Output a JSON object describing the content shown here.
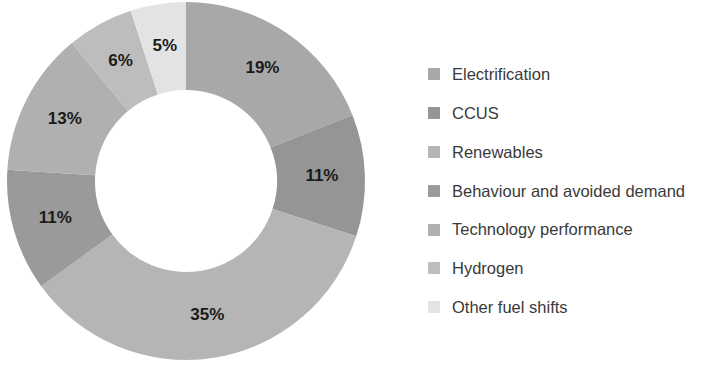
{
  "chart_data": {
    "type": "pie",
    "variant": "donut",
    "title": "",
    "subtitle": "",
    "xlabel": "",
    "ylabel": "",
    "units": "percent",
    "total": 100,
    "grid": false,
    "legend_position": "right",
    "start_angle_deg": 0,
    "direction": "clockwise",
    "inner_radius_ratio": 0.51,
    "categories": [
      "Electrification",
      "CCUS",
      "Renewables",
      "Behaviour and avoided demand",
      "Technology performance",
      "Hydrogen",
      "Other fuel shifts"
    ],
    "values": [
      19,
      11,
      35,
      11,
      13,
      6,
      5
    ],
    "value_labels": [
      "19%",
      "11%",
      "35%",
      "11%",
      "13%",
      "6%",
      "5%"
    ],
    "colors": [
      "#a8a8a8",
      "#959595",
      "#b5b5b5",
      "#9a9a9a",
      "#b0b0b0",
      "#bdbdbd",
      "#e3e3e3"
    ],
    "slices": [
      {
        "label": "Electrification",
        "value": 19,
        "value_label": "19%",
        "color": "#a8a8a8"
      },
      {
        "label": "CCUS",
        "value": 11,
        "value_label": "11%",
        "color": "#959595"
      },
      {
        "label": "Renewables",
        "value": 35,
        "value_label": "35%",
        "color": "#b5b5b5"
      },
      {
        "label": "Behaviour and avoided demand",
        "value": 11,
        "value_label": "11%",
        "color": "#9a9a9a"
      },
      {
        "label": "Technology performance",
        "value": 13,
        "value_label": "13%",
        "color": "#b0b0b0"
      },
      {
        "label": "Hydrogen",
        "value": 6,
        "value_label": "6%",
        "color": "#bdbdbd"
      },
      {
        "label": "Other fuel shifts",
        "value": 5,
        "value_label": "5%",
        "color": "#e3e3e3"
      }
    ]
  },
  "legend": {
    "items": [
      {
        "label": "Electrification",
        "color": "#a8a8a8"
      },
      {
        "label": "CCUS",
        "color": "#959595"
      },
      {
        "label": "Renewables",
        "color": "#b5b5b5"
      },
      {
        "label": "Behaviour and avoided demand",
        "color": "#9a9a9a"
      },
      {
        "label": "Technology performance",
        "color": "#b0b0b0"
      },
      {
        "label": "Hydrogen",
        "color": "#bdbdbd"
      },
      {
        "label": "Other fuel shifts",
        "color": "#e3e3e3"
      }
    ]
  },
  "geometry": {
    "center_x": 186,
    "center_y": 181,
    "outer_radius": 179,
    "inner_radius": 91,
    "label_radius": 136
  }
}
